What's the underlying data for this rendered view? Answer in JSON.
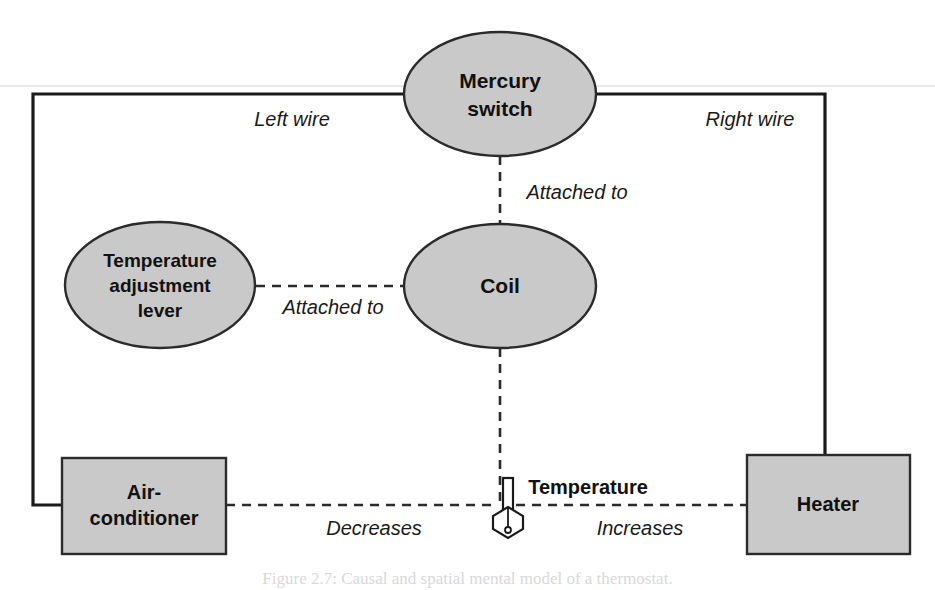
{
  "figure": {
    "caption": "Figure 2.7: Causal and spatial mental model of a thermostat.",
    "background_color": "#ffffff",
    "node_fill_color": "#c9c9c9",
    "node_stroke_color": "#2b2b2b",
    "wire_color": "#1a1a1a",
    "dashed_color": "#2b2b2b",
    "text_color": "#111111"
  },
  "nodes": {
    "mercury_switch": {
      "label_line1": "Mercury",
      "label_line2": "switch",
      "shape": "ellipse",
      "cx": 500,
      "cy": 94,
      "rx": 96,
      "ry": 62
    },
    "coil": {
      "label_line1": "Coil",
      "shape": "ellipse",
      "cx": 500,
      "cy": 286,
      "rx": 96,
      "ry": 62
    },
    "temperature_adjustment_lever": {
      "label_line1": "Temperature",
      "label_line2": "adjustment",
      "label_line3": "lever",
      "shape": "ellipse",
      "cx": 160,
      "cy": 285,
      "rx": 95,
      "ry": 63
    },
    "air_conditioner": {
      "label_line1": "Air-",
      "label_line2": "conditioner",
      "shape": "rect",
      "x": 62,
      "y": 458,
      "width": 164,
      "height": 96
    },
    "heater": {
      "label_line1": "Heater",
      "shape": "rect",
      "x": 747,
      "y": 455,
      "width": 163,
      "height": 99
    },
    "temperature": {
      "label_line1": "Temperature",
      "shape": "thermometer-icon",
      "x": 506,
      "y": 487
    }
  },
  "edges": [
    {
      "name": "left-wire",
      "label": "Left wire",
      "style": "solid",
      "label_x": 292,
      "label_y": 126
    },
    {
      "name": "right-wire",
      "label": "Right wire",
      "style": "solid",
      "label_x": 750,
      "label_y": 126
    },
    {
      "name": "switch-to-coil",
      "label": "Attached to",
      "style": "dashed",
      "label_x": 575,
      "label_y": 198
    },
    {
      "name": "lever-to-coil",
      "label": "Attached to",
      "style": "dashed",
      "label_x": 332,
      "label_y": 313
    },
    {
      "name": "airconditioner-to-temperature",
      "label": "Decreases",
      "style": "dashed",
      "label_x": 374,
      "label_y": 534
    },
    {
      "name": "heater-to-temperature",
      "label": "Increases",
      "style": "dashed",
      "label_x": 640,
      "label_y": 534
    }
  ],
  "icons": {
    "thermometer": "thermometer-icon"
  }
}
